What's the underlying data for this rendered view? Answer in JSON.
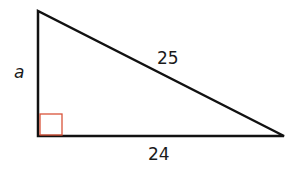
{
  "diagram": {
    "type": "right-triangle",
    "labels": {
      "left_side": "a",
      "hypotenuse": "25",
      "bottom_side": "24"
    },
    "colors": {
      "stroke": "#111111",
      "right_angle_marker": "#d9533a",
      "background": "#ffffff"
    }
  }
}
